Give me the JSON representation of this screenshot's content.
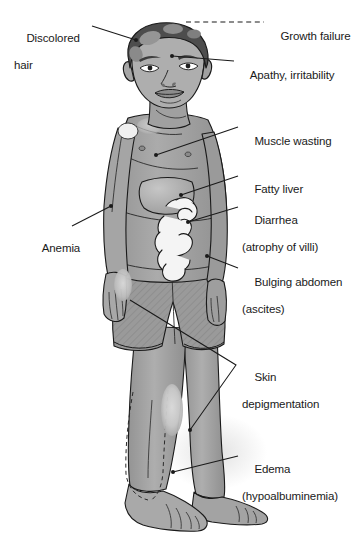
{
  "figure": {
    "style": "grayscale medical illustration",
    "background_color": "#ffffff",
    "line_color": "#1a1a1a"
  },
  "palette": {
    "skin": "#a3a3a3",
    "skin_shadow": "#8c8c8c",
    "skin_highlight": "#b8b8b8",
    "hair_dark": "#4a4a4a",
    "hair_patch": "#8f8f8f",
    "depigmented_patch": "#d8d8d8",
    "organ_liver": "#b5b5b5",
    "intestine_fill": "#f2f2f2",
    "shorts": "#9a9a9a",
    "ground_shadow": "#e4e4e4",
    "outline": "#1a1a1a"
  },
  "labels": [
    {
      "id": "discolored-hair",
      "line1": "Discolored",
      "line2": "hair",
      "side": "left",
      "text_x": 14,
      "text_y": 18,
      "leader": {
        "type": "solid",
        "from_x": 92,
        "from_y": 26,
        "to_x": 136,
        "to_y": 40
      },
      "marker": {
        "x": 136,
        "y": 40,
        "visible": true
      }
    },
    {
      "id": "growth-failure",
      "line1": "Growth failure",
      "line2": "",
      "side": "right",
      "text_x": 268,
      "text_y": 16,
      "leader": {
        "type": "dashed",
        "from_x": 186,
        "from_y": 22,
        "to_x": 264,
        "to_y": 22
      },
      "marker": {
        "x": 0,
        "y": 0,
        "visible": false
      }
    },
    {
      "id": "apathy-irritability",
      "line1": "Apathy, irritability",
      "line2": "",
      "side": "right",
      "text_x": 238,
      "text_y": 55,
      "leader": {
        "type": "solid",
        "from_x": 172,
        "from_y": 56,
        "to_x": 234,
        "to_y": 61
      },
      "marker": {
        "x": 172,
        "y": 56,
        "visible": true
      }
    },
    {
      "id": "muscle-wasting",
      "line1": "Muscle wasting",
      "line2": "",
      "side": "right",
      "text_x": 242,
      "text_y": 121,
      "leader": {
        "type": "solid",
        "from_x": 156,
        "from_y": 155,
        "to_x": 238,
        "to_y": 127
      },
      "marker": {
        "x": 156,
        "y": 155,
        "visible": true
      }
    },
    {
      "id": "fatty-liver",
      "line1": "Fatty liver",
      "line2": "",
      "side": "right",
      "text_x": 242,
      "text_y": 169,
      "leader": {
        "type": "solid",
        "from_x": 181,
        "from_y": 195,
        "to_x": 238,
        "to_y": 176
      },
      "marker": {
        "x": 181,
        "y": 195,
        "visible": true
      }
    },
    {
      "id": "diarrhea-atrophy-of-villi",
      "line1": "Diarrhea",
      "line2": "(atrophy of villi)",
      "side": "right",
      "text_x": 242,
      "text_y": 200,
      "leader": {
        "type": "solid",
        "from_x": 188,
        "from_y": 222,
        "to_x": 238,
        "to_y": 207
      },
      "marker": {
        "x": 188,
        "y": 222,
        "visible": true
      }
    },
    {
      "id": "bulging-abdomen-ascites",
      "line1": "Bulging abdomen",
      "line2": "(ascites)",
      "side": "right",
      "text_x": 242,
      "text_y": 262,
      "leader": {
        "type": "solid",
        "from_x": 207,
        "from_y": 256,
        "to_x": 238,
        "to_y": 268
      },
      "marker": {
        "x": 207,
        "y": 256,
        "visible": true
      }
    },
    {
      "id": "skin-depigmentation",
      "line1": "Skin",
      "line2": "depigmentation",
      "side": "right",
      "text_x": 242,
      "text_y": 357,
      "leader": {
        "type": "branched",
        "join_x": 236,
        "join_y": 365,
        "to_x": 130,
        "to_y": 300,
        "to2_x": 190,
        "to2_y": 430
      },
      "marker": {
        "x": 190,
        "y": 430,
        "visible": true
      }
    },
    {
      "id": "anemia",
      "line1": "Anemia",
      "line2": "",
      "side": "left",
      "text_x": 30,
      "text_y": 228,
      "leader": {
        "type": "solid",
        "from_x": 72,
        "from_y": 226,
        "to_x": 111,
        "to_y": 206
      },
      "marker": {
        "x": 111,
        "y": 206,
        "visible": true
      }
    },
    {
      "id": "edema-hypoalbuminemia",
      "line1": "Edema",
      "line2": "(hypoalbuminemia)",
      "side": "right",
      "text_x": 242,
      "text_y": 449,
      "leader": {
        "type": "solid",
        "from_x": 173,
        "from_y": 472,
        "to_x": 238,
        "to_y": 456
      },
      "marker": {
        "x": 173,
        "y": 472,
        "visible": true
      }
    }
  ]
}
